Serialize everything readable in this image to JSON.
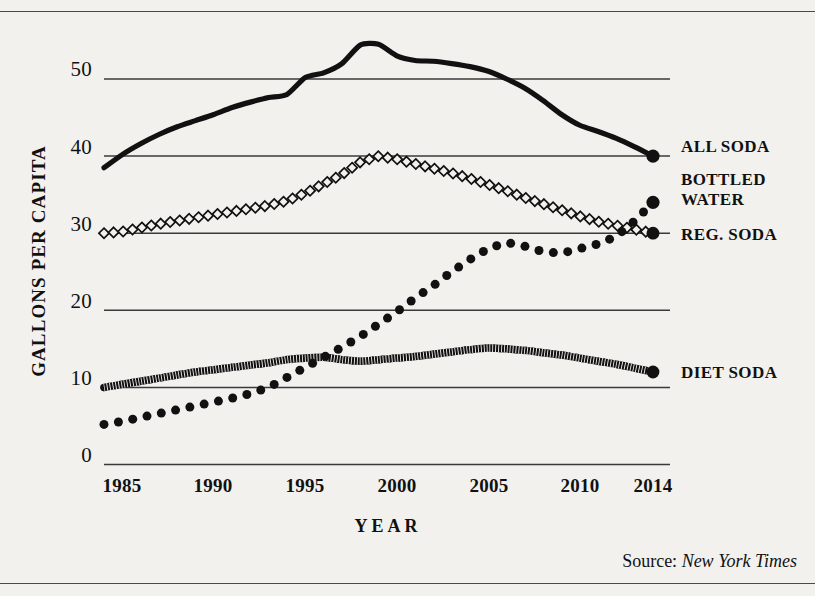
{
  "chart_data": {
    "type": "line",
    "title": "",
    "xlabel": "YEAR",
    "ylabel": "GALLONS PER CAPITA",
    "xlim": [
      1984,
      2014
    ],
    "ylim": [
      0,
      60
    ],
    "xticks": [
      "1985",
      "1990",
      "1995",
      "2000",
      "2005",
      "2010",
      "2014"
    ],
    "xtick_values": [
      1985,
      1990,
      1995,
      2000,
      2005,
      2010,
      2014
    ],
    "yticks": [
      "0",
      "10",
      "20",
      "30",
      "40",
      "50"
    ],
    "ytick_values": [
      0,
      10,
      20,
      30,
      40,
      50
    ],
    "grid": "horizontal",
    "legend_position": "right-inline",
    "source_prefix": "Source:",
    "source_name": "New York Times",
    "x": [
      1984,
      1985,
      1986,
      1987,
      1988,
      1989,
      1990,
      1991,
      1992,
      1993,
      1994,
      1995,
      1996,
      1997,
      1998,
      1999,
      2000,
      2001,
      2002,
      2003,
      2004,
      2005,
      2006,
      2007,
      2008,
      2009,
      2010,
      2011,
      2012,
      2013,
      2014
    ],
    "series": [
      {
        "name": "ALL SODA",
        "marker": "thick-solid-line",
        "endpoint_value": 40,
        "values": [
          38.5,
          40.2,
          41.6,
          42.8,
          43.8,
          44.6,
          45.4,
          46.3,
          47.0,
          47.6,
          48.0,
          50.2,
          50.8,
          52.0,
          54.4,
          54.5,
          53.0,
          52.4,
          52.3,
          52.0,
          51.6,
          51.0,
          50.0,
          48.8,
          47.2,
          45.4,
          44.0,
          43.2,
          42.3,
          41.2,
          40.0
        ]
      },
      {
        "name": "REG. SODA",
        "marker": "open-diamond",
        "endpoint_value": 30,
        "values": [
          30.0,
          30.2,
          30.7,
          31.2,
          31.6,
          32.0,
          32.4,
          32.8,
          33.2,
          33.6,
          34.2,
          35.2,
          36.4,
          37.6,
          39.2,
          40.0,
          39.6,
          39.0,
          38.4,
          37.8,
          37.1,
          36.3,
          35.5,
          34.6,
          33.8,
          33.0,
          32.2,
          31.5,
          31.0,
          30.5,
          30.0
        ]
      },
      {
        "name": "BOTTLED WATER",
        "marker": "filled-dot",
        "endpoint_value": 34,
        "values": [
          5.2,
          5.6,
          6.1,
          6.6,
          7.1,
          7.6,
          8.1,
          8.6,
          9.2,
          10.0,
          11.3,
          12.6,
          13.9,
          15.2,
          16.6,
          18.2,
          19.8,
          21.6,
          23.2,
          25.0,
          26.6,
          28.0,
          28.8,
          28.3,
          27.6,
          27.4,
          28.0,
          28.6,
          29.6,
          31.6,
          34.0
        ]
      },
      {
        "name": "DIET SODA",
        "marker": "hatched-band",
        "endpoint_value": 12,
        "values": [
          10.0,
          10.4,
          10.8,
          11.2,
          11.6,
          12.0,
          12.3,
          12.6,
          12.9,
          13.2,
          13.6,
          13.8,
          13.9,
          13.6,
          13.4,
          13.6,
          13.8,
          14.0,
          14.3,
          14.6,
          14.9,
          15.1,
          15.0,
          14.8,
          14.5,
          14.2,
          13.8,
          13.4,
          13.0,
          12.5,
          12.0
        ]
      }
    ]
  },
  "labels": {
    "all_soda": "ALL SODA",
    "bottled_water_line1": "BOTTLED",
    "bottled_water_line2": "WATER",
    "reg_soda": "REG. SODA",
    "diet_soda": "DIET SODA"
  },
  "colors": {
    "ink": "#111111",
    "gridline": "#3a3a3a",
    "background": "#f2f1ee"
  }
}
